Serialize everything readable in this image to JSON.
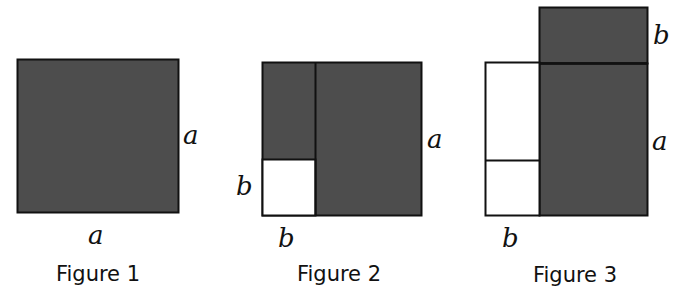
{
  "colors": {
    "shaded": "#4d4d4d",
    "unshaded": "#ffffff",
    "stroke": "#111111"
  },
  "figures": [
    {
      "caption": "Figure 1",
      "labels": {
        "right": "a",
        "bottom": "a"
      }
    },
    {
      "caption": "Figure 2",
      "labels": {
        "right": "a",
        "left": "b",
        "bottom": "b"
      }
    },
    {
      "caption": "Figure 3",
      "labels": {
        "top_right": "b",
        "right": "a",
        "bottom": "b"
      }
    }
  ]
}
